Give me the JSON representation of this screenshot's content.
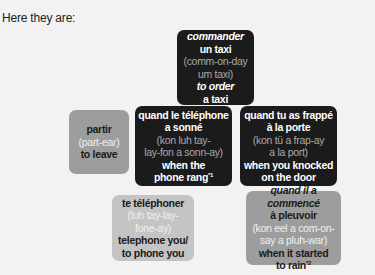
{
  "intro": "Here they are:",
  "cards": [
    {
      "french": [
        "commander",
        "un taxi"
      ],
      "pronunciation": [
        "(comm-on-day",
        "um taxi)"
      ],
      "english": [
        "to order",
        "a taxi"
      ],
      "style": "dark"
    },
    {
      "french": [
        "partir"
      ],
      "pronunciation": [
        "(part-ear)"
      ],
      "english": [
        "to leave"
      ],
      "style": "grey"
    },
    {
      "french": [
        "quand le téléphone",
        "a sonné"
      ],
      "pronunciation": [
        "(kon luh tay-",
        "lay-fon a sonn-ay)"
      ],
      "english": [
        "when the",
        "phone rang"
      ],
      "footnote": "*1",
      "style": "dark"
    },
    {
      "french": [
        "quand tu as frappé",
        "à la porte"
      ],
      "pronunciation": [
        "(kon tü a frap-ay",
        "a la port)"
      ],
      "english": [
        "when you knocked",
        "on the door"
      ],
      "style": "dark"
    },
    {
      "french": [
        "te téléphoner"
      ],
      "pronunciation": [
        "(tuh tay-lay-",
        "fone-ay)"
      ],
      "english": [
        "telephone you/",
        "to phone you"
      ],
      "style": "lightgrey"
    },
    {
      "french": [
        "quand il a commencé",
        "à pleuvoir"
      ],
      "pronunciation": [
        "(kon eel a com-on-",
        "say a pluh-war)"
      ],
      "english": [
        "when it started",
        "to rain"
      ],
      "footnote": "*2",
      "style": "grey"
    }
  ]
}
